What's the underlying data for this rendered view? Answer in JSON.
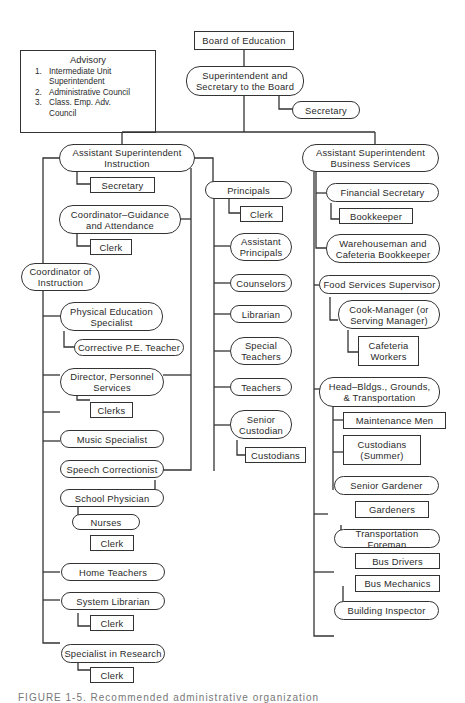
{
  "advisory": {
    "title": "Advisory",
    "items": [
      {
        "num": "1.",
        "label": "Intermediate Unit\n   Superintendent"
      },
      {
        "num": "2.",
        "label": "Administrative Council"
      },
      {
        "num": "3.",
        "label": "Class. Emp. Adv.\n   Council"
      }
    ]
  },
  "nodes": {
    "board": "Board of Education",
    "superintendent": "Superintendent and\nSecretary to the Board",
    "sup_secretary": "Secretary",
    "asst_instruction": "Assistant Superintendent\nInstruction",
    "ai_secretary": "Secretary",
    "coord_guidance": "Coordinator–Guidance\nand Attendance",
    "guidance_clerk": "Clerk",
    "coord_instruction": "Coordinator of\nInstruction",
    "pe_specialist": "Physical Education\nSpecialist",
    "corrective_pe": "Corrective P.E. Teacher",
    "director_personnel": "Director, Personnel\nServices",
    "clerks": "Clerks",
    "music": "Music Specialist",
    "speech": "Speech Correctionist",
    "physician": "School Physician",
    "nurses": "Nurses",
    "nurses_clerk": "Clerk",
    "home_teachers": "Home Teachers",
    "system_librarian": "System Librarian",
    "librarian_clerk": "Clerk",
    "research": "Specialist in Research",
    "research_clerk": "Clerk",
    "principals": "Principals",
    "principals_clerk": "Clerk",
    "asst_principals": "Assistant\nPrincipals",
    "counselors": "Counselors",
    "librarian": "Librarian",
    "special_teachers": "Special\nTeachers",
    "teachers": "Teachers",
    "senior_custodian": "Senior\nCustodian",
    "custodians": "Custodians",
    "asst_business": "Assistant Superintendent\nBusiness Services",
    "financial_secretary": "Financial Secretary",
    "bookkeeper": "Bookkeeper",
    "warehouseman": "Warehouseman and\nCafeteria Bookkeeper",
    "food_services": "Food Services Supervisor",
    "cook_manager": "Cook-Manager (or\nServing Manager)",
    "cafeteria_workers": "Cafeteria\nWorkers",
    "head_bldgs": "Head–Bldgs., Grounds,\n& Transportation",
    "maintenance": "Maintenance Men",
    "custodians_summer": "Custodians\n(Summer)",
    "senior_gardener": "Senior Gardener",
    "gardeners": "Gardeners",
    "transport_foreman": "Transportation Foreman",
    "bus_drivers": "Bus Drivers",
    "bus_mechanics": "Bus Mechanics",
    "building_inspector": "Building Inspector"
  },
  "caption": "FIGURE 1-5.  Recommended administrative organization"
}
